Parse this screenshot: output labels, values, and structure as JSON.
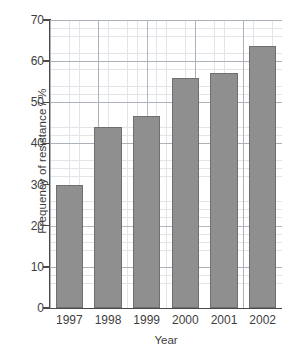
{
  "chart_data": {
    "type": "bar",
    "title": "",
    "xlabel": "Year",
    "ylabel": "Frequency of resistance / %",
    "categories": [
      "1997",
      "1998",
      "1999",
      "2000",
      "2001",
      "2002"
    ],
    "values": [
      30,
      44,
      46.7,
      56,
      57.2,
      63.7
    ],
    "series": [
      {
        "name": "Frequency of resistance",
        "values": [
          30,
          44,
          46.7,
          56,
          57.2,
          63.7
        ]
      }
    ],
    "ylim": [
      0,
      70
    ],
    "ytick_labels": [
      "0",
      "10",
      "20",
      "30",
      "40",
      "50",
      "60",
      "70"
    ],
    "ytick_values": [
      0,
      10,
      20,
      30,
      40,
      50,
      60,
      70
    ],
    "y_minor_step": 2,
    "x_minor_per_category": 4,
    "grid": true,
    "grid_minor": true,
    "legend": "none",
    "bar_color": "#8f8f8f",
    "bar_edge_color": "#6f6f6f",
    "grid_major_color": "#9aa2ab",
    "grid_minor_color": "#c9cfd6",
    "axis_color": "#4a4a4a",
    "background_color": "#ffffff"
  }
}
